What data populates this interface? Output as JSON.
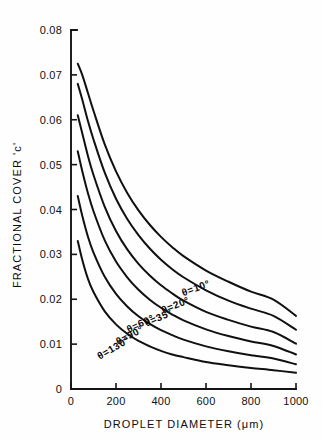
{
  "chart_data": {
    "type": "line",
    "title": "",
    "xlabel": "DROPLET DIAMETER (μm)",
    "ylabel": "FRACTIONAL COVER 'c'",
    "xlim": [
      0,
      1000
    ],
    "ylim": [
      0,
      0.08
    ],
    "xticks": [
      0,
      200,
      400,
      600,
      800,
      1000
    ],
    "xtick_labels": [
      "0",
      "200",
      "400",
      "600",
      "800",
      "1000"
    ],
    "yticks": [
      0,
      0.01,
      0.02,
      0.03,
      0.04,
      0.05,
      0.06,
      0.07,
      0.08
    ],
    "ytick_labels": [
      "0",
      "0.01",
      "0.02",
      "0.03",
      "0.04",
      "0.05",
      "0.06",
      "0.07",
      "0.08"
    ],
    "grid": false,
    "legend": "inline-curve-labels",
    "x": [
      30,
      50,
      75,
      100,
      150,
      200,
      250,
      300,
      350,
      400,
      450,
      500,
      600,
      700,
      800,
      900,
      1000
    ],
    "series": [
      {
        "name": "θ = 10°",
        "label": "θ=10°",
        "label_x": 560,
        "label_y": 0.0218,
        "label_rotation": -20,
        "values": [
          0.0725,
          0.07,
          0.066,
          0.062,
          0.0545,
          0.0485,
          0.0437,
          0.0398,
          0.0366,
          0.0339,
          0.0316,
          0.0296,
          0.0264,
          0.0239,
          0.0217,
          0.0199,
          0.0163
        ]
      },
      {
        "name": "θ = 20°",
        "label": "θ=20°",
        "label_x": 470,
        "label_y": 0.018,
        "label_rotation": -22,
        "values": [
          0.068,
          0.0645,
          0.0598,
          0.0556,
          0.0482,
          0.0424,
          0.0379,
          0.0343,
          0.0313,
          0.0288,
          0.0267,
          0.0249,
          0.022,
          0.0197,
          0.0179,
          0.0163,
          0.0132
        ]
      },
      {
        "name": "θ = 35°",
        "label": "θ=35°",
        "label_x": 395,
        "label_y": 0.0152,
        "label_rotation": -24,
        "values": [
          0.061,
          0.057,
          0.052,
          0.0477,
          0.0406,
          0.0352,
          0.0311,
          0.0279,
          0.0253,
          0.0231,
          0.0213,
          0.0197,
          0.0172,
          0.0154,
          0.0139,
          0.0127,
          0.0101
        ]
      },
      {
        "name": "θ = 60°",
        "label": "θ=60°",
        "label_x": 315,
        "label_y": 0.0139,
        "label_rotation": -26,
        "values": [
          0.053,
          0.0486,
          0.0437,
          0.0396,
          0.0331,
          0.0284,
          0.0249,
          0.0221,
          0.0199,
          0.0181,
          0.0166,
          0.0153,
          0.0133,
          0.0118,
          0.0106,
          0.0096,
          0.0077
        ]
      },
      {
        "name": "θ = 90°",
        "label": "θ=90°",
        "label_x": 268,
        "label_y": 0.0113,
        "label_rotation": -28,
        "values": [
          0.043,
          0.0386,
          0.034,
          0.0304,
          0.025,
          0.0212,
          0.0184,
          0.0162,
          0.0145,
          0.0131,
          0.012,
          0.011,
          0.0095,
          0.0084,
          0.0075,
          0.0068,
          0.0055
        ]
      },
      {
        "name": "θ = 130°",
        "label": "θ=130°",
        "label_x": 196,
        "label_y": 0.0085,
        "label_rotation": -30,
        "values": [
          0.033,
          0.0288,
          0.0246,
          0.0216,
          0.0173,
          0.0144,
          0.0123,
          0.0107,
          0.0095,
          0.0085,
          0.0077,
          0.0071,
          0.006,
          0.0053,
          0.0047,
          0.0042,
          0.0036
        ]
      }
    ]
  }
}
